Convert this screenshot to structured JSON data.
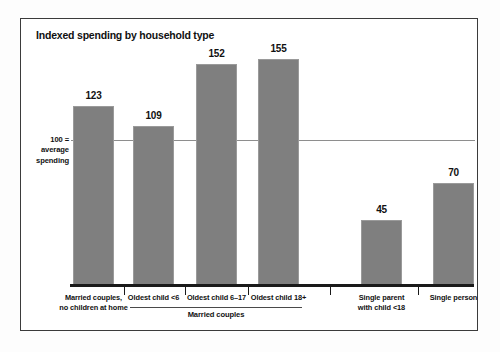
{
  "figure": {
    "background_color": "#ffffff",
    "frame_color": "#3b3b3b"
  },
  "chart_data": {
    "type": "bar",
    "title": "Indexed spending by household type",
    "xlabel": "",
    "ylabel": "100 = average spending",
    "ylim": [
      0,
      175
    ],
    "grid": false,
    "legend": null,
    "bar_color": "#7f7f7f",
    "reference_line": {
      "value": 100,
      "label_lines": [
        "100 =",
        "average",
        "spending"
      ],
      "color": "#8e8e8e"
    },
    "categories": [
      "Married couples, no children at home",
      "Oldest child <6",
      "Oldest child 6–17",
      "Oldest child 18+",
      "Single parent with child <18",
      "Single person"
    ],
    "category_label_lines": [
      [
        "Married couples,",
        "no children at home"
      ],
      [
        "Oldest child <6"
      ],
      [
        "Oldest child 6–17"
      ],
      [
        "Oldest child 18+"
      ],
      [
        "Single parent",
        "with child <18"
      ],
      [
        "Single person"
      ]
    ],
    "values": [
      123,
      109,
      152,
      155,
      45,
      70
    ],
    "value_labels": [
      "123",
      "109",
      "152",
      "155",
      "45",
      "70"
    ],
    "groups": [
      {
        "label": "Married couples",
        "member_indices": [
          1,
          2,
          3
        ]
      }
    ]
  }
}
